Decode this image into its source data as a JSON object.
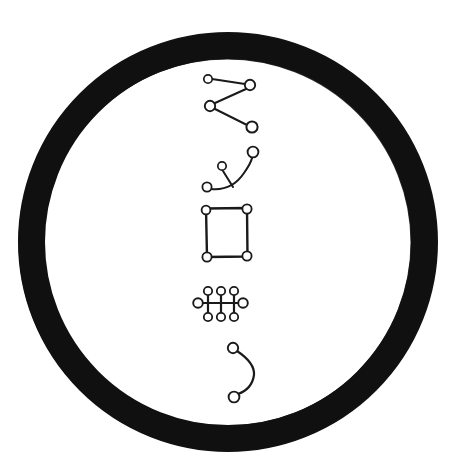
{
  "canvas": {
    "width": 456,
    "height": 472,
    "background_color": "#ffffff",
    "ink_color": "#1a1a1a",
    "ring_color": "#111111"
  },
  "ring": {
    "name": "enclosing-circle",
    "center_x": 228,
    "center_y": 242,
    "outer_radius": 210,
    "inner_radius": 183,
    "stroke_width": 27,
    "style": "hand-drawn-thick-ink-ring"
  },
  "glyphs": [
    {
      "id": "zigzag",
      "label": "zigzag-four-node-glyph",
      "order": 1,
      "node_count": 4,
      "edge_count": 3,
      "nodes": [
        {
          "id": "z1",
          "x": 208,
          "y": 79,
          "r": 4.2
        },
        {
          "id": "z2",
          "x": 250,
          "y": 85,
          "r": 5.2
        },
        {
          "id": "z3",
          "x": 210,
          "y": 106,
          "r": 5.2
        },
        {
          "id": "z4",
          "x": 252,
          "y": 127,
          "r": 5.6
        }
      ],
      "edges": [
        {
          "from": "z1",
          "to": "z2"
        },
        {
          "from": "z2",
          "to": "z3"
        },
        {
          "from": "z3",
          "to": "z4"
        }
      ],
      "stroke_width": 2
    },
    {
      "id": "branched-arc",
      "label": "curved-arc-with-branch-glyph",
      "order": 2,
      "node_count": 3,
      "edge_count": 2,
      "nodes": [
        {
          "id": "a1",
          "x": 207,
          "y": 187,
          "r": 4.6
        },
        {
          "id": "a2",
          "x": 222,
          "y": 166,
          "r": 4.2
        },
        {
          "id": "a3",
          "x": 253,
          "y": 152,
          "r": 5.4
        }
      ],
      "edges": [
        {
          "from": "a1",
          "to": "a3",
          "shape": "arc"
        },
        {
          "from": "a2",
          "to": "curve-midpoint",
          "shape": "straight"
        }
      ],
      "arc_path": "M 210 188 Q 233 190 246 171 Q 252 161 252 157",
      "branch_path": "M 223 170 L 233 186",
      "stroke_width": 2
    },
    {
      "id": "square",
      "label": "square-four-corner-node-glyph",
      "order": 3,
      "node_count": 4,
      "edge_count": 4,
      "bounds": {
        "left": 204,
        "top": 208,
        "right": 250,
        "bottom": 258
      },
      "nodes": [
        {
          "id": "s1",
          "x": 206,
          "y": 210,
          "r": 4.4
        },
        {
          "id": "s2",
          "x": 247,
          "y": 209,
          "r": 4.6
        },
        {
          "id": "s3",
          "x": 207,
          "y": 257,
          "r": 4.6
        },
        {
          "id": "s4",
          "x": 247,
          "y": 256,
          "r": 4.6
        }
      ],
      "edges": [
        {
          "from": "s1",
          "to": "s2"
        },
        {
          "from": "s2",
          "to": "s4"
        },
        {
          "from": "s4",
          "to": "s3"
        },
        {
          "from": "s3",
          "to": "s1"
        }
      ],
      "stroke_width": 2.4
    },
    {
      "id": "comb",
      "label": "comb-ladder-glyph",
      "order": 4,
      "node_count": 8,
      "edge_count": 4,
      "spine": {
        "x1": 200,
        "y1": 303,
        "x2": 241,
        "y2": 303
      },
      "nodes": [
        {
          "id": "c-left",
          "x": 198,
          "y": 303,
          "r": 4.8
        },
        {
          "id": "c-right",
          "x": 243,
          "y": 303,
          "r": 4.8
        },
        {
          "id": "c-t1",
          "x": 208,
          "y": 292,
          "r": 4.2
        },
        {
          "id": "c-t2",
          "x": 221,
          "y": 292,
          "r": 4.2
        },
        {
          "id": "c-t3",
          "x": 234,
          "y": 292,
          "r": 4.2
        },
        {
          "id": "c-b1",
          "x": 208,
          "y": 316,
          "r": 4.2
        },
        {
          "id": "c-b2",
          "x": 221,
          "y": 316,
          "r": 4.2
        },
        {
          "id": "c-b3",
          "x": 234,
          "y": 316,
          "r": 4.2
        }
      ],
      "rungs": [
        {
          "x": 208,
          "y1": 294,
          "y2": 314
        },
        {
          "x": 221,
          "y1": 294,
          "y2": 314
        },
        {
          "x": 234,
          "y1": 294,
          "y2": 314
        }
      ],
      "stroke_width": 2.2
    },
    {
      "id": "c-arc",
      "label": "c-shaped-arc-glyph",
      "order": 5,
      "node_count": 2,
      "edge_count": 1,
      "nodes": [
        {
          "id": "b1",
          "x": 233,
          "y": 348,
          "r": 5.2
        },
        {
          "id": "b2",
          "x": 234,
          "y": 397,
          "r": 5.4
        }
      ],
      "edges": [
        {
          "from": "b1",
          "to": "b2",
          "shape": "arc-bulge-right"
        }
      ],
      "arc_path": "M 237 351 Q 256 364 254 375 Q 251 389 238 395",
      "stroke_width": 2.2
    }
  ]
}
